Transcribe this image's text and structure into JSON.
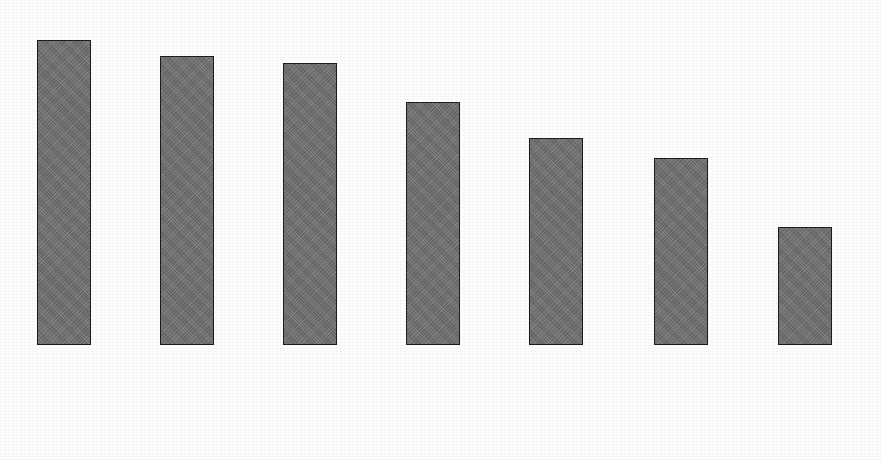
{
  "chart_data": {
    "type": "bar",
    "title": "",
    "subtitle": "",
    "xlabel": "",
    "ylabel": "",
    "ylim": [
      0,
      100
    ],
    "grid": false,
    "legend": null,
    "value_suffix": "%",
    "categories": [
      "Number of tickets per day",
      "Average ticket",
      "Number of store visits",
      "Number of items purchased",
      "Number of clients registered in loyalty programmes",
      "Period of time between two visits to the store",
      "Time spent by the client in the store"
    ],
    "values": [
      93,
      88,
      86,
      74,
      63,
      57,
      36
    ],
    "value_labels": [
      "93%",
      "88%",
      "86%",
      "74%",
      "63%",
      "57%",
      "36%"
    ],
    "bars": [
      {
        "value": 93,
        "value_label": "93%",
        "center_x": 64,
        "label_lines": [
          "Number of",
          "tickets",
          "per day"
        ]
      },
      {
        "value": 88,
        "value_label": "88%",
        "center_x": 187,
        "label_lines": [
          "Average ticket"
        ]
      },
      {
        "value": 86,
        "value_label": "86%",
        "center_x": 310,
        "label_lines": [
          "Number of",
          "store visits"
        ]
      },
      {
        "value": 74,
        "value_label": "74%",
        "center_x": 433,
        "label_lines": [
          "Number of",
          "items",
          "purchased"
        ]
      },
      {
        "value": 63,
        "value_label": "63%",
        "center_x": 556,
        "label_lines": [
          "Number of",
          "clients registered",
          "in loyalty",
          "programmes"
        ]
      },
      {
        "value": 57,
        "value_label": "57%",
        "center_x": 681,
        "label_lines": [
          "Period of",
          "time between",
          "two visits",
          "to the store"
        ]
      },
      {
        "value": 36,
        "value_label": "36%",
        "center_x": 805,
        "label_lines": [
          "Time spent",
          "by the client",
          "in the store"
        ]
      }
    ],
    "colors": {
      "bar_fill": "#6f6f6f",
      "bar_border": "#1c1c1c",
      "text": "#111111",
      "background": "#fdfdfd"
    }
  }
}
